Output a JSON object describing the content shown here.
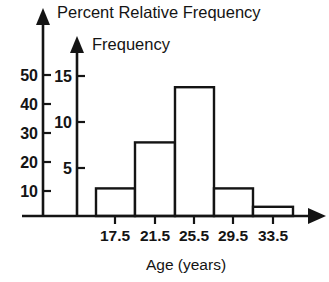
{
  "chart_data": {
    "type": "bar",
    "title": "",
    "xlabel": "Age (years)",
    "ylabel": "Percent Relative Frequency",
    "ylabel_secondary": "Frequency",
    "categories": [
      "17.5",
      "21.5",
      "25.5",
      "29.5",
      "33.5"
    ],
    "values": [
      3,
      8,
      14,
      3,
      1
    ],
    "series": [
      {
        "name": "Frequency",
        "values": [
          3,
          8,
          14,
          3,
          1
        ]
      },
      {
        "name": "Percent Relative Frequency",
        "values": [
          10,
          27,
          47,
          10,
          3
        ]
      }
    ],
    "ylim": [
      0,
      16
    ],
    "ylim_secondary": [
      0,
      55
    ],
    "yticks_frequency": [
      "5",
      "10",
      "15"
    ],
    "yticks_percent": [
      "10",
      "20",
      "30",
      "40",
      "50"
    ],
    "grid": false,
    "legend": "none",
    "axis_color": "#141414",
    "bar_fill": "#ffffff",
    "bar_stroke": "#141414"
  },
  "axes": {
    "percent": {
      "title": "Percent Relative Frequency",
      "ticks": [
        {
          "label": "10",
          "value": 10
        },
        {
          "label": "20",
          "value": 20
        },
        {
          "label": "30",
          "value": 30
        },
        {
          "label": "40",
          "value": 40
        },
        {
          "label": "50",
          "value": 50
        }
      ]
    },
    "frequency": {
      "title": "Frequency",
      "ticks": [
        {
          "label": "5",
          "value": 5
        },
        {
          "label": "10",
          "value": 10
        },
        {
          "label": "15",
          "value": 15
        }
      ]
    },
    "x": {
      "title": "Age (years)",
      "ticks": [
        {
          "label": "17.5"
        },
        {
          "label": "21.5"
        },
        {
          "label": "25.5"
        },
        {
          "label": "29.5"
        },
        {
          "label": "33.5"
        }
      ]
    }
  }
}
